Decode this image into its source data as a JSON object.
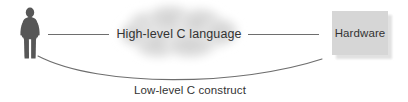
{
  "diagram": {
    "type": "concept-diagram",
    "background_color": "#ffffff",
    "line_color": "#6e6e6e",
    "text_color": "#333333",
    "actor": {
      "icon": "person-silhouette-icon",
      "color": "#575757"
    },
    "cloud": {
      "label": "High-level C language",
      "fill_color": "#d9d9d9"
    },
    "box": {
      "label": "Hardware",
      "fill_color": "#d6d6d6",
      "shadow_color": "#c9c9c9"
    },
    "arc": {
      "label": "Low-level C construct",
      "stroke_color": "#6e6e6e"
    },
    "connectors": {
      "left_line": "person-to-cloud-line",
      "right_line": "cloud-to-hardware-line"
    }
  }
}
